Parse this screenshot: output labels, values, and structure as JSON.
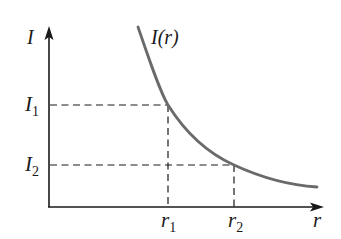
{
  "diagram": {
    "type": "intensity-vs-distance",
    "y_axis_label": "I",
    "x_axis_label": "r",
    "curve_label": "I(r)",
    "y_ticks": [
      {
        "main": "I",
        "sub": "1"
      },
      {
        "main": "I",
        "sub": "2"
      }
    ],
    "x_ticks": [
      {
        "main": "r",
        "sub": "1"
      },
      {
        "main": "r",
        "sub": "2"
      }
    ],
    "colors": {
      "axis": "#1a1a1a",
      "curve": "#6a6a6a",
      "dashed": "#1a1a1a"
    }
  }
}
